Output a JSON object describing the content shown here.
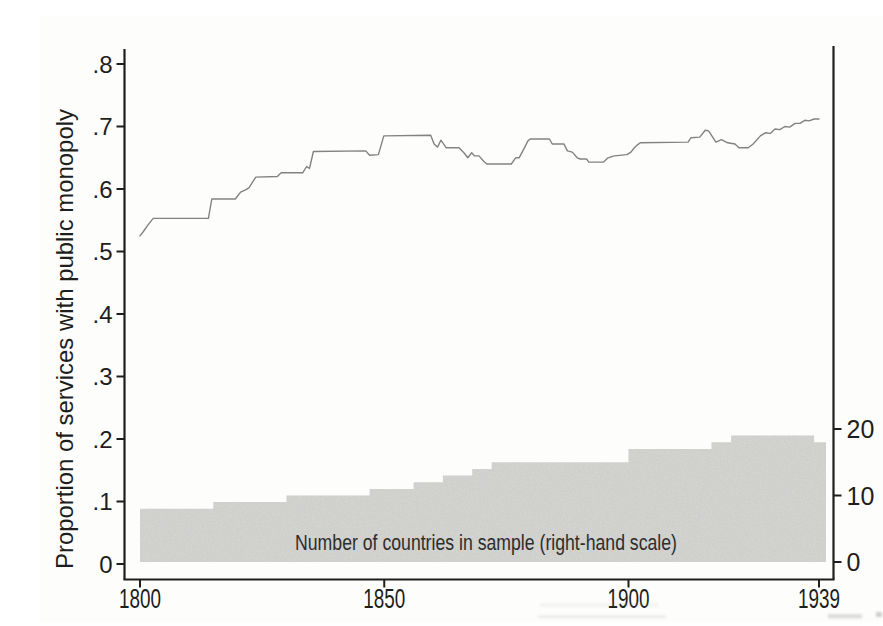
{
  "palette": {
    "paper": "#fdfdfb",
    "axis": "#1e1e1c",
    "line": "#828282",
    "area": "#d6d6d3",
    "annotation_text": "#2d2d2b"
  },
  "chart_data": {
    "type": "line",
    "title": "",
    "x_axis": {
      "label": "",
      "tick_labels": [
        "1800",
        "1850",
        "1900",
        "1939"
      ],
      "tick_values": [
        1800,
        1850,
        1900,
        1939
      ],
      "range": [
        1800,
        1939
      ]
    },
    "left_y_axis": {
      "label": "Proportion of services with public monopoly",
      "tick_labels": [
        "0",
        ".1",
        ".2",
        ".3",
        ".4",
        ".5",
        ".6",
        ".7",
        ".8"
      ],
      "tick_values": [
        0,
        0.1,
        0.2,
        0.3,
        0.4,
        0.5,
        0.6,
        0.7,
        0.8
      ],
      "range": [
        0,
        0.85
      ]
    },
    "right_y_axis": {
      "label": "Number of countries in sample",
      "tick_labels": [
        "0",
        "10",
        "20"
      ],
      "tick_values": [
        0,
        10,
        20
      ],
      "range": [
        0,
        20.5
      ]
    },
    "annotation": "Number of countries in sample (right-hand scale)",
    "legend": "none",
    "grid": "off",
    "series": [
      {
        "name": "Proportion of services with public monopoly",
        "type": "line",
        "axis": "left",
        "points": [
          [
            1800.0,
            0.525
          ],
          [
            1800.7,
            0.532
          ],
          [
            1801.5,
            0.541
          ],
          [
            1802.7,
            0.553
          ],
          [
            1814.0,
            0.553
          ],
          [
            1814.7,
            0.584
          ],
          [
            1819.5,
            0.584
          ],
          [
            1820.6,
            0.595
          ],
          [
            1821.7,
            0.599
          ],
          [
            1822.3,
            0.602
          ],
          [
            1823.7,
            0.619
          ],
          [
            1828.1,
            0.62
          ],
          [
            1828.9,
            0.626
          ],
          [
            1833.3,
            0.626
          ],
          [
            1834.1,
            0.636
          ],
          [
            1834.7,
            0.633
          ],
          [
            1835.5,
            0.66
          ],
          [
            1846.2,
            0.661
          ],
          [
            1847.0,
            0.654
          ],
          [
            1848.8,
            0.655
          ],
          [
            1849.9,
            0.685
          ],
          [
            1859.5,
            0.686
          ],
          [
            1860.2,
            0.672
          ],
          [
            1860.9,
            0.667
          ],
          [
            1861.6,
            0.678
          ],
          [
            1862.7,
            0.666
          ],
          [
            1865.3,
            0.666
          ],
          [
            1866.3,
            0.658
          ],
          [
            1867.1,
            0.65
          ],
          [
            1867.9,
            0.658
          ],
          [
            1868.5,
            0.653
          ],
          [
            1869.4,
            0.653
          ],
          [
            1870.4,
            0.644
          ],
          [
            1871.0,
            0.64
          ],
          [
            1876.0,
            0.64
          ],
          [
            1876.9,
            0.65
          ],
          [
            1877.6,
            0.65
          ],
          [
            1878.7,
            0.666
          ],
          [
            1879.4,
            0.677
          ],
          [
            1879.9,
            0.68
          ],
          [
            1883.8,
            0.68
          ],
          [
            1884.4,
            0.672
          ],
          [
            1886.8,
            0.672
          ],
          [
            1887.5,
            0.661
          ],
          [
            1888.5,
            0.659
          ],
          [
            1889.5,
            0.65
          ],
          [
            1890.1,
            0.648
          ],
          [
            1891.4,
            0.648
          ],
          [
            1891.9,
            0.643
          ],
          [
            1894.9,
            0.643
          ],
          [
            1895.8,
            0.65
          ],
          [
            1897.1,
            0.653
          ],
          [
            1899.7,
            0.655
          ],
          [
            1900.5,
            0.659
          ],
          [
            1901.2,
            0.666
          ],
          [
            1901.9,
            0.671
          ],
          [
            1902.4,
            0.674
          ],
          [
            1912.2,
            0.675
          ],
          [
            1912.8,
            0.682
          ],
          [
            1914.6,
            0.683
          ],
          [
            1915.7,
            0.694
          ],
          [
            1916.4,
            0.693
          ],
          [
            1917.3,
            0.682
          ],
          [
            1917.9,
            0.675
          ],
          [
            1919.0,
            0.679
          ],
          [
            1920.3,
            0.674
          ],
          [
            1921.8,
            0.672
          ],
          [
            1922.6,
            0.666
          ],
          [
            1924.5,
            0.666
          ],
          [
            1925.5,
            0.672
          ],
          [
            1927.0,
            0.685
          ],
          [
            1928.0,
            0.69
          ],
          [
            1929.0,
            0.689
          ],
          [
            1930.0,
            0.696
          ],
          [
            1931.0,
            0.695
          ],
          [
            1932.0,
            0.7
          ],
          [
            1933.0,
            0.699
          ],
          [
            1934.1,
            0.705
          ],
          [
            1935.1,
            0.705
          ],
          [
            1936.1,
            0.71
          ],
          [
            1937.0,
            0.709
          ],
          [
            1938.0,
            0.712
          ],
          [
            1939.0,
            0.712
          ]
        ]
      },
      {
        "name": "Number of countries in sample",
        "type": "step-area",
        "axis": "right",
        "steps": [
          [
            1800,
            8
          ],
          [
            1815,
            9
          ],
          [
            1830,
            10
          ],
          [
            1847,
            11
          ],
          [
            1856,
            12
          ],
          [
            1862,
            13
          ],
          [
            1868,
            14
          ],
          [
            1872,
            15
          ],
          [
            1900,
            17
          ],
          [
            1917,
            18
          ],
          [
            1921,
            19
          ],
          [
            1938,
            18
          ]
        ]
      }
    ]
  }
}
